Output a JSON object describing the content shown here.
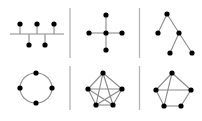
{
  "diagram": {
    "type": "network-topologies",
    "colors": {
      "background": "#ffffff",
      "node": "#000000",
      "edge": "#8a8a8a",
      "divider": "#b5b5b5"
    },
    "node_radius": 2.6,
    "dividers": [
      {
        "x": 70,
        "y1": 8,
        "y2": 58
      },
      {
        "x": 70,
        "y1": 66,
        "y2": 110
      },
      {
        "x": 139.5,
        "y1": 8,
        "y2": 58
      },
      {
        "x": 139.5,
        "y1": 66,
        "y2": 110
      }
    ],
    "panels": [
      {
        "id": "bus",
        "name": "bus-topology",
        "bus": {
          "x1": 10,
          "y": 34,
          "x2": 64
        },
        "nodes": [
          {
            "x": 20,
            "y": 24
          },
          {
            "x": 37,
            "y": 24
          },
          {
            "x": 54,
            "y": 24
          },
          {
            "x": 29,
            "y": 45
          },
          {
            "x": 45,
            "y": 45
          }
        ],
        "edges": [
          [
            20,
            24,
            20,
            34
          ],
          [
            37,
            24,
            37,
            34
          ],
          [
            54,
            24,
            54,
            34
          ],
          [
            29,
            45,
            29,
            34
          ],
          [
            45,
            45,
            45,
            34
          ]
        ]
      },
      {
        "id": "star",
        "name": "star-topology",
        "nodes": [
          {
            "x": 106,
            "y": 33
          },
          {
            "x": 106,
            "y": 15
          },
          {
            "x": 106,
            "y": 50
          },
          {
            "x": 89,
            "y": 33
          },
          {
            "x": 122,
            "y": 33
          }
        ],
        "edges": [
          [
            106,
            33,
            106,
            15
          ],
          [
            106,
            33,
            106,
            50
          ],
          [
            106,
            33,
            89,
            33
          ],
          [
            106,
            33,
            122,
            33
          ]
        ]
      },
      {
        "id": "tree",
        "name": "tree-topology",
        "nodes": [
          {
            "x": 167,
            "y": 14
          },
          {
            "x": 158,
            "y": 33
          },
          {
            "x": 179,
            "y": 33
          },
          {
            "x": 170,
            "y": 53
          },
          {
            "x": 192,
            "y": 53
          }
        ],
        "edges": [
          [
            167,
            14,
            158,
            33
          ],
          [
            167,
            14,
            179,
            33
          ],
          [
            179,
            33,
            170,
            53
          ],
          [
            179,
            33,
            192,
            53
          ]
        ]
      },
      {
        "id": "ring",
        "name": "ring-topology",
        "ellipse": {
          "cx": 36,
          "cy": 88,
          "rx": 16,
          "ry": 15
        },
        "nodes": [
          {
            "x": 36,
            "y": 73
          },
          {
            "x": 20,
            "y": 88
          },
          {
            "x": 52,
            "y": 88
          },
          {
            "x": 36,
            "y": 103
          }
        ],
        "edges": []
      },
      {
        "id": "full-mesh",
        "name": "full-mesh-topology",
        "nodes": [
          {
            "x": 103,
            "y": 73
          },
          {
            "x": 88,
            "y": 89
          },
          {
            "x": 122,
            "y": 89
          },
          {
            "x": 96,
            "y": 105
          },
          {
            "x": 113,
            "y": 105
          }
        ],
        "edges": [
          [
            103,
            73,
            88,
            89
          ],
          [
            103,
            73,
            122,
            89
          ],
          [
            103,
            73,
            96,
            105
          ],
          [
            103,
            73,
            113,
            105
          ],
          [
            88,
            89,
            122,
            89
          ],
          [
            88,
            89,
            96,
            105
          ],
          [
            88,
            89,
            113,
            105
          ],
          [
            122,
            89,
            96,
            105
          ],
          [
            122,
            89,
            113,
            105
          ],
          [
            96,
            105,
            113,
            105
          ]
        ]
      },
      {
        "id": "partial-mesh",
        "name": "partial-mesh-topology",
        "nodes": [
          {
            "x": 172,
            "y": 73
          },
          {
            "x": 156,
            "y": 90
          },
          {
            "x": 191,
            "y": 90
          },
          {
            "x": 164,
            "y": 106
          },
          {
            "x": 181,
            "y": 106
          }
        ],
        "edges": [
          [
            172,
            73,
            156,
            90
          ],
          [
            172,
            73,
            191,
            90
          ],
          [
            172,
            73,
            164,
            106
          ],
          [
            156,
            90,
            191,
            90
          ],
          [
            156,
            90,
            164,
            106
          ],
          [
            164,
            106,
            181,
            106
          ],
          [
            181,
            106,
            191,
            90
          ]
        ]
      }
    ]
  }
}
